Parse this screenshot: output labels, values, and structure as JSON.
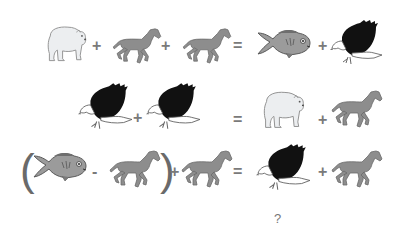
{
  "puzzle": {
    "rows": [
      {
        "lhs": [
          "bear",
          "+",
          "horse",
          "+",
          "horse"
        ],
        "rhs": [
          "fish",
          "+",
          "eagle"
        ]
      },
      {
        "lhs": [
          "eagle",
          "+",
          "eagle"
        ],
        "rhs": [
          "bear",
          "+",
          "horse"
        ]
      },
      {
        "lhs": [
          "(",
          "fish",
          "-",
          "horse",
          ")",
          "+",
          "horse"
        ],
        "rhs": [
          "eagle",
          "+",
          "horse"
        ]
      }
    ],
    "symbols": {
      "plus": "+",
      "minus": "-",
      "equals": "=",
      "open_paren": "(",
      "close_paren": ")"
    },
    "question": "?"
  }
}
